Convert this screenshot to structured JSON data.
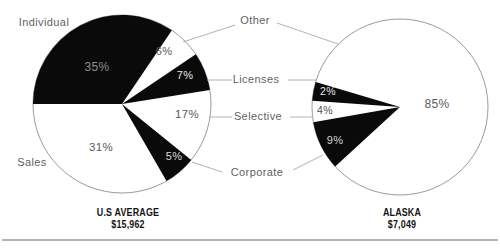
{
  "chart_data": {
    "type": "pie",
    "legend_position": "center-column-between-pies",
    "grid": false,
    "colors": {
      "background": "#ffffff",
      "slice_black": "#0a0a0a",
      "slice_white": "#ffffff",
      "outline": "#9b9b9b",
      "connector": "#a9a9a9",
      "category_label": "#5f5f5f",
      "caption_text": "#141414",
      "rule": "#b3b3b3"
    },
    "pies": [
      {
        "id": "us-average",
        "caption": {
          "name": "U.S AVERAGE",
          "amount": "$15,962"
        },
        "start_angle_deg": 180,
        "slices": [
          {
            "label": "Individual",
            "value": 35,
            "pct_text": "35%",
            "fill": "black",
            "text_color": "#8f8f8f",
            "span_deg": 124.1
          },
          {
            "label": "Other",
            "value": 6,
            "pct_text": "6%",
            "fill": "white",
            "text_color": "#5a5a5a",
            "span_deg": 21.9
          },
          {
            "label": "Licenses",
            "value": 7,
            "pct_text": "7%",
            "fill": "black",
            "text_color": "#e8e8e8",
            "span_deg": 25.0
          },
          {
            "label": "Selective",
            "value": 17,
            "pct_text": "17%",
            "fill": "white",
            "text_color": "#5a5a5a",
            "span_deg": 48.0
          },
          {
            "label": "Corporate",
            "value": 5,
            "pct_text": "5%",
            "fill": "black",
            "text_color": "#dcdcdc",
            "span_deg": 21.0
          },
          {
            "label": "Sales",
            "value": 31,
            "pct_text": "31%",
            "fill": "white",
            "text_color": "#5a5a5a",
            "span_deg": 120.0
          }
        ]
      },
      {
        "id": "alaska",
        "caption": {
          "name": "ALASKA",
          "amount": "$7,049"
        },
        "start_angle_deg": 163.4,
        "slices": [
          {
            "label": "Other",
            "value": 85,
            "pct_text": "85%",
            "fill": "white",
            "text_color": "#5a5a5a",
            "span_deg": 300.8
          },
          {
            "label": "Corporate",
            "value": 9,
            "pct_text": "9%",
            "fill": "black",
            "text_color": "#d6d6d6",
            "span_deg": 32.6
          },
          {
            "label": "Selective",
            "value": 4,
            "pct_text": "4%",
            "fill": "white",
            "text_color": "#4f4f4f",
            "span_deg": 14.1
          },
          {
            "label": "Licenses",
            "value": 2,
            "pct_text": "2%",
            "fill": "black",
            "text_color": "#e8e8e8",
            "span_deg": 12.5
          }
        ]
      }
    ]
  }
}
